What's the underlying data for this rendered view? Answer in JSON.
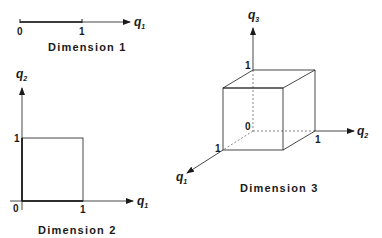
{
  "colors": {
    "ink": "#1a1a1a",
    "background": "#ffffff"
  },
  "dim1": {
    "caption": "Dimension 1",
    "axis": {
      "name": "q",
      "sub": "1"
    },
    "ticks": [
      "0",
      "1"
    ]
  },
  "dim2": {
    "caption": "Dimension 2",
    "x_axis": {
      "name": "q",
      "sub": "1"
    },
    "y_axis": {
      "name": "q",
      "sub": "2"
    },
    "origin": "0",
    "x_tick": "1",
    "y_tick": "1"
  },
  "dim3": {
    "caption": "Dimension 3",
    "axis1": {
      "name": "q",
      "sub": "1"
    },
    "axis2": {
      "name": "q",
      "sub": "2"
    },
    "axis3": {
      "name": "q",
      "sub": "3"
    },
    "origin": "0",
    "tick1": "1",
    "tick2": "1",
    "tick3": "1"
  }
}
